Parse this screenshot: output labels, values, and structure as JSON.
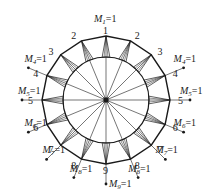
{
  "diagram": {
    "node_count": 16,
    "top_node_label": "1",
    "bottom_node_label": "9",
    "side_node_labels": [
      "2",
      "3",
      "4",
      "5",
      "6",
      "7",
      "8"
    ],
    "colors": {
      "line": "#1a1a1a",
      "text": "#222222",
      "background": "#ffffff"
    },
    "loads": [
      {
        "id": "M1",
        "symbol": "M",
        "subscript": "1",
        "value": "=1",
        "node": "1",
        "side": "top"
      },
      {
        "id": "M4-left",
        "symbol": "M",
        "subscript": "4",
        "value": "=1",
        "node": "4",
        "side": "left"
      },
      {
        "id": "M4-right",
        "symbol": "M",
        "subscript": "4",
        "value": "=1",
        "node": "4",
        "side": "right"
      },
      {
        "id": "M5-left",
        "symbol": "M",
        "subscript": "5",
        "value": "=1",
        "node": "5",
        "side": "left"
      },
      {
        "id": "M5-right",
        "symbol": "M",
        "subscript": "5",
        "value": "=1",
        "node": "5",
        "side": "right"
      },
      {
        "id": "M6-left",
        "symbol": "M",
        "subscript": "6",
        "value": "=1",
        "node": "6",
        "side": "left"
      },
      {
        "id": "M6-right",
        "symbol": "M",
        "subscript": "6",
        "value": "=1",
        "node": "6",
        "side": "right"
      },
      {
        "id": "M7-left",
        "symbol": "M",
        "subscript": "7",
        "value": "=1",
        "node": "7",
        "side": "left"
      },
      {
        "id": "M7-right",
        "symbol": "M",
        "subscript": "7",
        "value": "=1",
        "node": "7",
        "side": "right"
      },
      {
        "id": "M8-left",
        "symbol": "M",
        "subscript": "8",
        "value": "=1",
        "node": "8",
        "side": "left"
      },
      {
        "id": "M8-right",
        "symbol": "M",
        "subscript": "8",
        "value": "=1",
        "node": "8",
        "side": "right"
      },
      {
        "id": "M9",
        "symbol": "M",
        "subscript": "9",
        "value": "=1",
        "node": "9",
        "side": "bottom"
      }
    ]
  }
}
